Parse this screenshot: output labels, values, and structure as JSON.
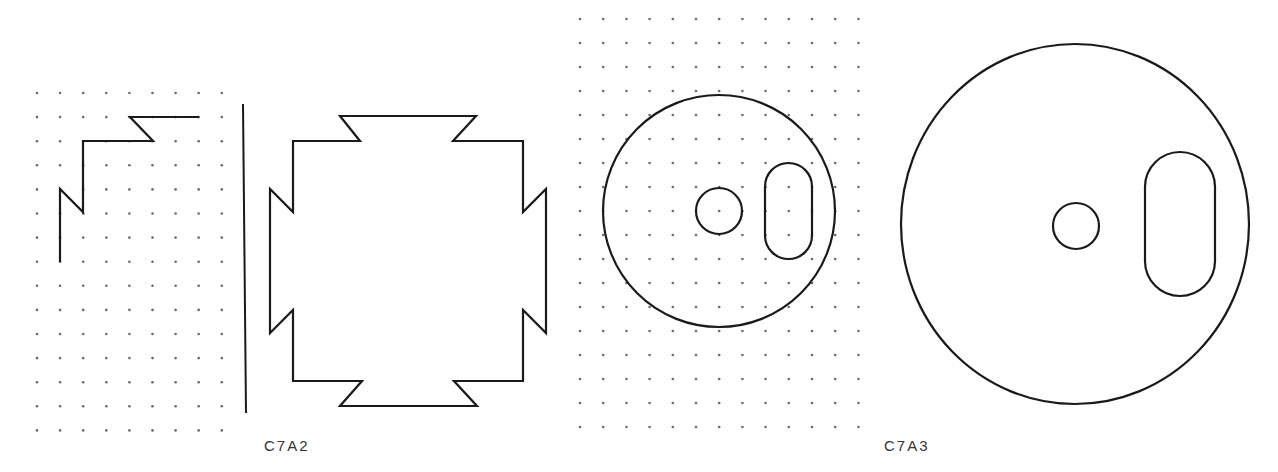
{
  "figure": {
    "labels": [
      {
        "id": "c7a2",
        "text": "C7A2",
        "x": 264,
        "y": 437
      },
      {
        "id": "c7a3",
        "text": "C7A3",
        "x": 884,
        "y": 437
      }
    ],
    "colors": {
      "ink": "#1a1a1a",
      "dot": "#6a6a6a",
      "background": "#ffffff",
      "label": "#333333"
    },
    "panels": [
      {
        "id": "panel-1-grid-quarter",
        "description": "Quarter outline drawn on dot grid",
        "grid": {
          "x0": 37,
          "y0": 93,
          "dx": 23.1,
          "dy": 24.1,
          "cols": 9,
          "rows": 15
        },
        "path": [
          [
            199,
            117
          ],
          [
            130,
            117
          ],
          [
            153,
            141
          ],
          [
            83,
            141
          ],
          [
            83,
            212
          ],
          [
            60,
            189
          ],
          [
            60,
            262
          ]
        ]
      },
      {
        "id": "panel-divider",
        "line": [
          [
            243,
            104
          ],
          [
            246,
            413
          ]
        ]
      },
      {
        "id": "panel-2-full-shape",
        "description": "Full symmetric notched outline (C7A2)",
        "path": [
          [
            340,
            116
          ],
          [
            476,
            116
          ],
          [
            453,
            141
          ],
          [
            523,
            141
          ],
          [
            523,
            212
          ],
          [
            546,
            189
          ],
          [
            546,
            333
          ],
          [
            523,
            310
          ],
          [
            523,
            381
          ],
          [
            454,
            381
          ],
          [
            477,
            406
          ],
          [
            340,
            406
          ],
          [
            362,
            381
          ],
          [
            293,
            381
          ],
          [
            293,
            310
          ],
          [
            270,
            333
          ],
          [
            270,
            189
          ],
          [
            293,
            212
          ],
          [
            293,
            141
          ],
          [
            360,
            141
          ]
        ]
      },
      {
        "id": "panel-3-grid-disc",
        "description": "Disc with hole and slot drawn on dot grid",
        "grid": {
          "x0": 580,
          "y0": 19,
          "dx": 23.2,
          "dy": 24.0,
          "cols": 13,
          "rows": 18
        },
        "outer_circle": {
          "cx": 719,
          "cy": 211,
          "r": 116
        },
        "hole": {
          "cx": 719,
          "cy": 211,
          "r": 23
        },
        "slot": {
          "x": 765,
          "y": 163,
          "w": 47,
          "h": 96
        }
      },
      {
        "id": "panel-4-disc",
        "description": "Enlarged disc with hole and slot (C7A3)",
        "outer_circle": {
          "cx": 1075,
          "cy": 224,
          "rx": 174,
          "ry": 180
        },
        "hole": {
          "cx": 1076,
          "cy": 226,
          "r": 23
        },
        "slot": {
          "x": 1145,
          "y": 152,
          "w": 70,
          "h": 144
        }
      }
    ]
  }
}
